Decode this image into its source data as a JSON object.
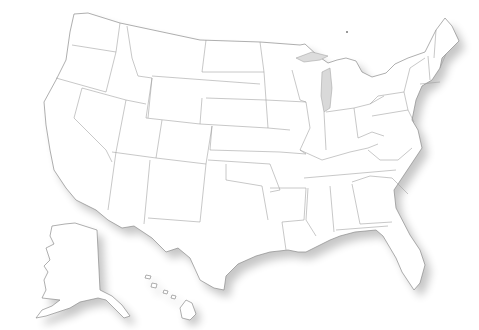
{
  "map": {
    "type": "blank-outline-map",
    "region": "United States",
    "background_color": "#ffffff",
    "fill_color": "#ffffff",
    "stroke_color": "#8c8c8c",
    "shadow": true,
    "insets": [
      "Alaska",
      "Hawaii"
    ],
    "states_shown": 50,
    "labels": []
  }
}
